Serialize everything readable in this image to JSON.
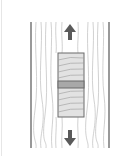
{
  "diagram": {
    "colors": {
      "background": "#ffffff",
      "border": "#555555",
      "grain": "#b8b8b8",
      "block_fill": "#e2e2e2",
      "block_stroke": "#6a6a6a",
      "joint_fill": "#a8a8a8",
      "arrow": "#5a5a5a"
    },
    "arrows": [
      {
        "direction": "up",
        "position": "top"
      },
      {
        "direction": "down",
        "position": "bottom"
      }
    ]
  }
}
